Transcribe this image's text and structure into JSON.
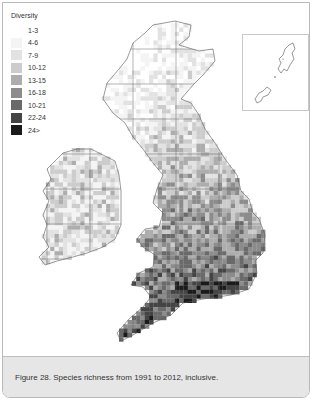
{
  "legend": {
    "title": "Diversity",
    "items": [
      {
        "label": "1-3",
        "color": "#ffffff"
      },
      {
        "label": "4-6",
        "color": "#f4f4f4"
      },
      {
        "label": "7-9",
        "color": "#e2e2e2"
      },
      {
        "label": "10-12",
        "color": "#cccccc"
      },
      {
        "label": "13-15",
        "color": "#adadad"
      },
      {
        "label": "16-18",
        "color": "#8c8c8c"
      },
      {
        "label": "10-21",
        "color": "#6a6a6a"
      },
      {
        "label": "22-24",
        "color": "#444444"
      },
      {
        "label": "24>",
        "color": "#1a1a1a"
      }
    ]
  },
  "map": {
    "regions": [
      "Scotland",
      "Ireland",
      "Northern England",
      "Wales",
      "Southern England",
      "Shetland (inset)"
    ],
    "inset_label": "Shetland inset"
  },
  "caption": {
    "text": "Figure 28. Species richness from 1991 to 2012, inclusive."
  }
}
